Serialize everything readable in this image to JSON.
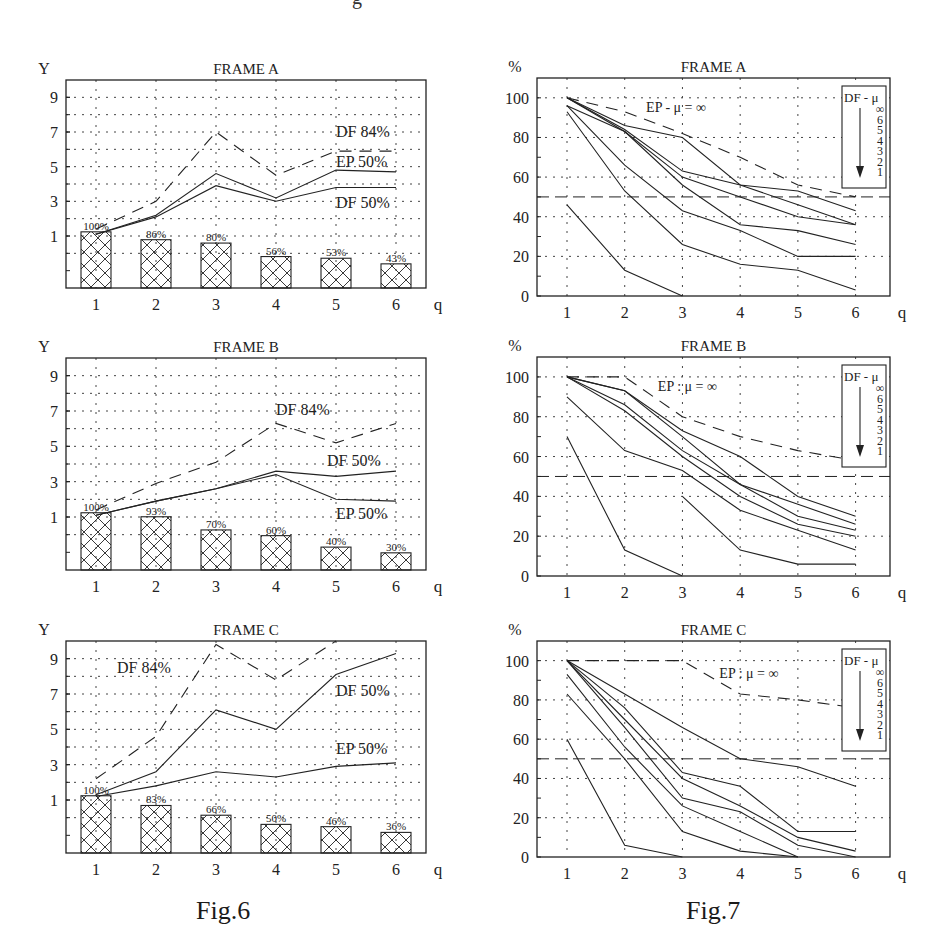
{
  "page": {
    "top_fragment": "g",
    "captions": {
      "fig6": "Fig.6",
      "fig7": "Fig.7"
    }
  },
  "chart_data": [
    {
      "id": "fig6-frame-a",
      "figure": "Fig.6",
      "type": "line",
      "title": "FRAME A",
      "xlabel": "q",
      "ylabel": "Y",
      "x": [
        1,
        2,
        3,
        4,
        5,
        6
      ],
      "yticks": [
        1,
        3,
        5,
        7,
        9
      ],
      "ylim": [
        -2,
        10
      ],
      "grid": true,
      "series": [
        {
          "name": "DF 84%",
          "style": "dashed",
          "values": [
            1.4,
            3.0,
            7.0,
            4.5,
            5.9,
            5.9
          ]
        },
        {
          "name": "EP 50%",
          "style": "solid",
          "values": [
            1.1,
            2.2,
            4.6,
            3.2,
            4.8,
            4.7
          ]
        },
        {
          "name": "DF 50%",
          "style": "solid",
          "values": [
            1.1,
            2.1,
            3.9,
            3.0,
            3.8,
            3.8
          ]
        }
      ],
      "labels": [
        {
          "text": "DF 84%",
          "x": 5.0,
          "y": 6.7
        },
        {
          "text": "EP 50%",
          "x": 5.0,
          "y": 5.0
        },
        {
          "text": "DF 50%",
          "x": 5.0,
          "y": 2.6
        }
      ],
      "bars": {
        "labels": [
          "100%",
          "86%",
          "80%",
          "56%",
          "53%",
          "43%"
        ],
        "values": [
          100,
          86,
          80,
          56,
          53,
          43
        ]
      }
    },
    {
      "id": "fig6-frame-b",
      "figure": "Fig.6",
      "type": "line",
      "title": "FRAME B",
      "xlabel": "q",
      "ylabel": "Y",
      "x": [
        1,
        2,
        3,
        4,
        5,
        6
      ],
      "yticks": [
        1,
        3,
        5,
        7,
        9
      ],
      "ylim": [
        -2,
        10
      ],
      "grid": true,
      "series": [
        {
          "name": "DF 84%",
          "style": "dashed",
          "values": [
            1.4,
            2.9,
            4.1,
            6.3,
            5.2,
            6.3
          ]
        },
        {
          "name": "DF 50%",
          "style": "solid",
          "values": [
            1.1,
            1.9,
            2.6,
            3.6,
            3.3,
            3.6
          ]
        },
        {
          "name": "EP 50%",
          "style": "solid",
          "values": [
            1.1,
            1.9,
            2.6,
            3.4,
            2.0,
            1.9
          ]
        }
      ],
      "labels": [
        {
          "text": "DF 84%",
          "x": 4.0,
          "y": 6.8
        },
        {
          "text": "DF 50%",
          "x": 4.85,
          "y": 3.9
        },
        {
          "text": "EP 50%",
          "x": 5.0,
          "y": 0.9
        }
      ],
      "bars": {
        "labels": [
          "100%",
          "93%",
          "70%",
          "60%",
          "40%",
          "30%"
        ],
        "values": [
          100,
          93,
          70,
          60,
          40,
          30
        ]
      }
    },
    {
      "id": "fig6-frame-c",
      "figure": "Fig.6",
      "type": "line",
      "title": "FRAME C",
      "xlabel": "q",
      "ylabel": "Y",
      "x": [
        1,
        2,
        3,
        4,
        5,
        6
      ],
      "yticks": [
        1,
        3,
        5,
        7,
        9
      ],
      "ylim": [
        -2,
        10
      ],
      "grid": true,
      "series": [
        {
          "name": "DF 84%",
          "style": "dashed",
          "values": [
            2.2,
            4.6,
            9.8,
            7.8,
            10.5,
            null
          ]
        },
        {
          "name": "DF 50%",
          "style": "solid",
          "values": [
            1.3,
            2.6,
            6.1,
            5.0,
            8.1,
            9.3
          ]
        },
        {
          "name": "EP 50%",
          "style": "solid",
          "values": [
            1.2,
            1.8,
            2.6,
            2.3,
            2.9,
            3.1
          ]
        }
      ],
      "labels": [
        {
          "text": "DF 84%",
          "x": 1.35,
          "y": 8.2
        },
        {
          "text": "DF 50%",
          "x": 5.0,
          "y": 6.9
        },
        {
          "text": "EP 50%",
          "x": 5.0,
          "y": 3.6
        }
      ],
      "bars": {
        "labels": [
          "100%",
          "83%",
          "66%",
          "50%",
          "46%",
          "36%"
        ],
        "values": [
          100,
          83,
          66,
          50,
          46,
          36
        ]
      }
    },
    {
      "id": "fig7-frame-a",
      "figure": "Fig.7",
      "type": "line",
      "title": "FRAME A",
      "xlabel": "q",
      "ylabel": "%",
      "x": [
        1,
        2,
        3,
        4,
        5,
        6
      ],
      "yticks": [
        0,
        20,
        40,
        60,
        80,
        100
      ],
      "ylim": [
        0,
        110
      ],
      "grid": true,
      "reference_line": 50,
      "ep_label": "EP - μ = ∞",
      "ep_label_pos": {
        "x": 2.35,
        "y": 93
      },
      "legend": {
        "title": "DF - μ",
        "items": [
          "∞",
          "6",
          "5",
          "4",
          "3",
          "2",
          "1"
        ]
      },
      "series": [
        {
          "name": "EP μ=∞",
          "style": "dashed",
          "values": [
            100,
            93,
            82,
            70,
            56,
            50
          ]
        },
        {
          "name": "DF μ=∞",
          "style": "solid",
          "values": [
            100,
            86,
            80,
            56,
            53,
            43
          ]
        },
        {
          "name": "DF μ=6",
          "style": "solid",
          "values": [
            100,
            84,
            63,
            56,
            46,
            36
          ]
        },
        {
          "name": "DF μ=5",
          "style": "solid",
          "values": [
            100,
            83,
            60,
            50,
            40,
            36
          ]
        },
        {
          "name": "DF μ=4",
          "style": "solid",
          "values": [
            96,
            83,
            56,
            36,
            33,
            26
          ]
        },
        {
          "name": "DF μ=3",
          "style": "solid",
          "values": [
            96,
            66,
            43,
            33,
            20,
            20
          ]
        },
        {
          "name": "DF μ=2",
          "style": "solid",
          "values": [
            93,
            53,
            26,
            16,
            13,
            3
          ]
        },
        {
          "name": "DF μ=1",
          "style": "solid",
          "values": [
            46,
            13,
            0,
            null,
            null,
            null
          ]
        }
      ]
    },
    {
      "id": "fig7-frame-b",
      "figure": "Fig.7",
      "type": "line",
      "title": "FRAME B",
      "xlabel": "q",
      "ylabel": "%",
      "x": [
        1,
        2,
        3,
        4,
        5,
        6
      ],
      "yticks": [
        0,
        20,
        40,
        60,
        80,
        100
      ],
      "ylim": [
        0,
        110
      ],
      "grid": true,
      "reference_line": 50,
      "ep_label": "EP : μ = ∞",
      "ep_label_pos": {
        "x": 2.55,
        "y": 93
      },
      "legend": {
        "title": "DF - μ",
        "items": [
          "∞",
          "6",
          "5",
          "4",
          "3",
          "2",
          "1"
        ]
      },
      "series": [
        {
          "name": "EP μ=∞",
          "style": "dashed",
          "values": [
            100,
            100,
            80,
            70,
            63,
            58
          ]
        },
        {
          "name": "DF μ=∞",
          "style": "solid",
          "values": [
            100,
            93,
            73,
            60,
            40,
            30
          ]
        },
        {
          "name": "DF μ=6",
          "style": "solid",
          "values": [
            100,
            93,
            70,
            46,
            36,
            26
          ]
        },
        {
          "name": "DF μ=5",
          "style": "solid",
          "values": [
            100,
            86,
            63,
            46,
            30,
            23
          ]
        },
        {
          "name": "DF μ=4",
          "style": "solid",
          "values": [
            100,
            83,
            60,
            40,
            26,
            20
          ]
        },
        {
          "name": "DF μ=3",
          "style": "solid",
          "values": [
            90,
            63,
            53,
            33,
            23,
            13
          ]
        },
        {
          "name": "DF μ=2",
          "style": "solid",
          "values": [
            null,
            null,
            40,
            13,
            6,
            6
          ]
        },
        {
          "name": "DF μ=1",
          "style": "solid",
          "values": [
            70,
            13,
            0,
            null,
            null,
            null
          ]
        }
      ]
    },
    {
      "id": "fig7-frame-c",
      "figure": "Fig.7",
      "type": "line",
      "title": "FRAME C",
      "xlabel": "q",
      "ylabel": "%",
      "x": [
        1,
        2,
        3,
        4,
        5,
        6
      ],
      "yticks": [
        0,
        20,
        40,
        60,
        80,
        100
      ],
      "ylim": [
        0,
        110
      ],
      "grid": true,
      "reference_line": 50,
      "ep_label": "EP : μ = ∞",
      "ep_label_pos": {
        "x": 3.6,
        "y": 91
      },
      "legend": {
        "title": "DF - μ",
        "items": [
          "∞",
          "6",
          "5",
          "4",
          "3",
          "2",
          "1"
        ]
      },
      "series": [
        {
          "name": "EP μ=∞",
          "style": "dashed",
          "values": [
            100,
            100,
            100,
            83,
            80,
            76
          ]
        },
        {
          "name": "DF μ=∞",
          "style": "solid",
          "values": [
            100,
            83,
            66,
            50,
            46,
            36
          ]
        },
        {
          "name": "DF μ=6",
          "style": "solid",
          "values": [
            100,
            76,
            43,
            36,
            13,
            13
          ]
        },
        {
          "name": "DF μ=5",
          "style": "solid",
          "values": [
            100,
            70,
            40,
            26,
            10,
            3
          ]
        },
        {
          "name": "DF μ=4",
          "style": "solid",
          "values": [
            100,
            66,
            30,
            23,
            6,
            0
          ]
        },
        {
          "name": "DF μ=3",
          "style": "solid",
          "values": [
            93,
            56,
            26,
            13,
            0,
            null
          ]
        },
        {
          "name": "DF μ=2",
          "style": "solid",
          "values": [
            83,
            50,
            13,
            3,
            0,
            null
          ]
        },
        {
          "name": "DF μ=1",
          "style": "solid",
          "values": [
            60,
            6,
            0,
            null,
            null,
            null
          ]
        }
      ]
    }
  ]
}
